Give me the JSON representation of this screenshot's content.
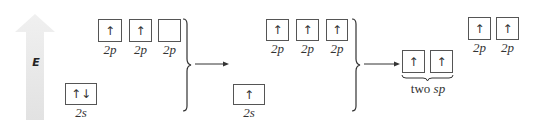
{
  "energy_axis": {
    "label": "E",
    "color": "#e6e6e6"
  },
  "stage1": {
    "p_orbitals": [
      {
        "label": "2p",
        "electrons": "↑"
      },
      {
        "label": "2p",
        "electrons": "↑"
      },
      {
        "label": "2p",
        "electrons": ""
      }
    ],
    "s_orbital": {
      "label": "2s",
      "electrons": "↑↓"
    }
  },
  "stage2": {
    "p_orbitals": [
      {
        "label": "2p",
        "electrons": "↑"
      },
      {
        "label": "2p",
        "electrons": "↑"
      },
      {
        "label": "2p",
        "electrons": "↑"
      }
    ],
    "s_orbital": {
      "label": "2s",
      "electrons": "↑"
    }
  },
  "stage3": {
    "sp_orbitals": [
      {
        "electrons": "↑"
      },
      {
        "electrons": "↑"
      }
    ],
    "sp_label_prefix": "two ",
    "sp_label_italic": "sp",
    "p_orbitals": [
      {
        "label": "2p",
        "electrons": "↑"
      },
      {
        "label": "2p",
        "electrons": "↑"
      }
    ]
  }
}
